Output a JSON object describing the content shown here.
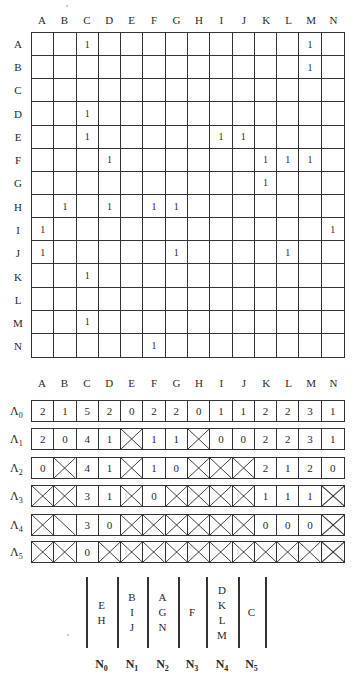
{
  "columns": [
    "A",
    "B",
    "C",
    "D",
    "E",
    "F",
    "G",
    "H",
    "I",
    "J",
    "K",
    "L",
    "M",
    "N"
  ],
  "matrix": {
    "rows": [
      {
        "label": "A",
        "cells": [
          "",
          "",
          "1",
          "",
          "",
          "",
          "",
          "",
          "",
          "",
          "",
          "",
          "1",
          ""
        ]
      },
      {
        "label": "B",
        "cells": [
          "",
          "",
          "",
          "",
          "",
          "",
          "",
          "",
          "",
          "",
          "",
          "",
          "1",
          ""
        ]
      },
      {
        "label": "C",
        "cells": [
          "",
          "",
          "",
          "",
          "",
          "",
          "",
          "",
          "",
          "",
          "",
          "",
          "",
          ""
        ]
      },
      {
        "label": "D",
        "cells": [
          "",
          "",
          "1",
          "",
          "",
          "",
          "",
          "",
          "",
          "",
          "",
          "",
          "",
          ""
        ]
      },
      {
        "label": "E",
        "cells": [
          "",
          "",
          "1",
          "",
          "",
          "",
          "",
          "",
          "1",
          "1",
          "",
          "",
          "",
          ""
        ]
      },
      {
        "label": "F",
        "cells": [
          "",
          "",
          "",
          "1",
          "",
          "",
          "",
          "",
          "",
          "",
          "1",
          "1",
          "1",
          ""
        ]
      },
      {
        "label": "G",
        "cells": [
          "",
          "",
          "",
          "",
          "",
          "",
          "",
          "",
          "",
          "",
          "1",
          "",
          "",
          ""
        ]
      },
      {
        "label": "H",
        "cells": [
          "",
          "1",
          "",
          "1",
          "",
          "1",
          "1",
          "",
          "",
          "",
          "",
          "",
          "",
          ""
        ]
      },
      {
        "label": "I",
        "cells": [
          "1",
          "",
          "",
          "",
          "",
          "",
          "",
          "",
          "",
          "",
          "",
          "",
          "",
          "1"
        ]
      },
      {
        "label": "J",
        "cells": [
          "1",
          "",
          "",
          "",
          "",
          "",
          "1",
          "",
          "",
          "",
          "",
          "1",
          "",
          ""
        ]
      },
      {
        "label": "K",
        "cells": [
          "",
          "",
          "1",
          "",
          "",
          "",
          "",
          "",
          "",
          "",
          "",
          "",
          "",
          ""
        ]
      },
      {
        "label": "L",
        "cells": [
          "",
          "",
          "",
          "",
          "",
          "",
          "",
          "",
          "",
          "",
          "",
          "",
          "",
          ""
        ]
      },
      {
        "label": "M",
        "cells": [
          "",
          "",
          "1",
          "",
          "",
          "",
          "",
          "",
          "",
          "",
          "",
          "",
          "",
          ""
        ]
      },
      {
        "label": "N",
        "cells": [
          "",
          "",
          "",
          "",
          "",
          "1",
          "",
          "",
          "",
          "",
          "",
          "",
          "",
          ""
        ]
      }
    ]
  },
  "lambda": {
    "cross_marker": "X",
    "half_cross_marker": "\\",
    "rows": [
      {
        "symbol": "Λ",
        "sub": "0",
        "top": 400,
        "cells": [
          "2",
          "1",
          "5",
          "2",
          "0",
          "2",
          "2",
          "0",
          "1",
          "1",
          "2",
          "2",
          "3",
          "1"
        ]
      },
      {
        "symbol": "Λ",
        "sub": "1",
        "top": 428,
        "cells": [
          "2",
          "0",
          "4",
          "1",
          "X",
          "1",
          "1",
          "X",
          "0",
          "0",
          "2",
          "2",
          "3",
          "1"
        ]
      },
      {
        "symbol": "Λ",
        "sub": "2",
        "top": 457,
        "cells": [
          "0",
          "X",
          "4",
          "1",
          "X",
          "1",
          "0",
          "X",
          "X",
          "X",
          "2",
          "1",
          "2",
          "0"
        ]
      },
      {
        "symbol": "Λ",
        "sub": "3",
        "top": 485,
        "cells": [
          "X",
          "X",
          "3",
          "1",
          "X",
          "0",
          "X",
          "X",
          "X",
          "X",
          "1",
          "1",
          "1",
          "X"
        ]
      },
      {
        "symbol": "Λ",
        "sub": "4",
        "top": 514,
        "cells": [
          "X",
          "\\",
          "3",
          "0",
          "X",
          "X",
          "X",
          "X",
          "X",
          "X",
          "0",
          "0",
          "0",
          "X"
        ]
      },
      {
        "symbol": "Λ",
        "sub": "5",
        "top": 541,
        "cells": [
          "X",
          "X",
          "0",
          "X",
          "X",
          "X",
          "X",
          "X",
          "X",
          "X",
          "X",
          "X",
          "X",
          "X"
        ]
      }
    ]
  },
  "levels": [
    {
      "name": "N",
      "sub": "0",
      "members": [
        "E",
        "H"
      ]
    },
    {
      "name": "N",
      "sub": "1",
      "members": [
        "B",
        "I",
        "J"
      ]
    },
    {
      "name": "N",
      "sub": "2",
      "members": [
        "A",
        "G",
        "N"
      ]
    },
    {
      "name": "N",
      "sub": "3",
      "members": [
        "F"
      ]
    },
    {
      "name": "N",
      "sub": "4",
      "members": [
        "D",
        "K",
        "L",
        "M"
      ]
    },
    {
      "name": "N",
      "sub": "5",
      "members": [
        "C"
      ]
    }
  ]
}
